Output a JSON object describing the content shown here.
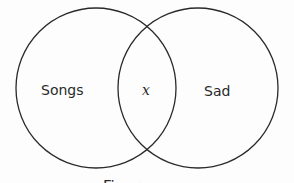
{
  "diagram": {
    "type": "venn",
    "sets": [
      {
        "label": "Songs",
        "cx": 96,
        "cy": 88,
        "r": 80
      },
      {
        "label": "Sad",
        "cx": 198,
        "cy": 88,
        "r": 80
      }
    ],
    "intersection_label": "x",
    "caption": "Figure",
    "stroke_color": "#2a2a2a"
  }
}
